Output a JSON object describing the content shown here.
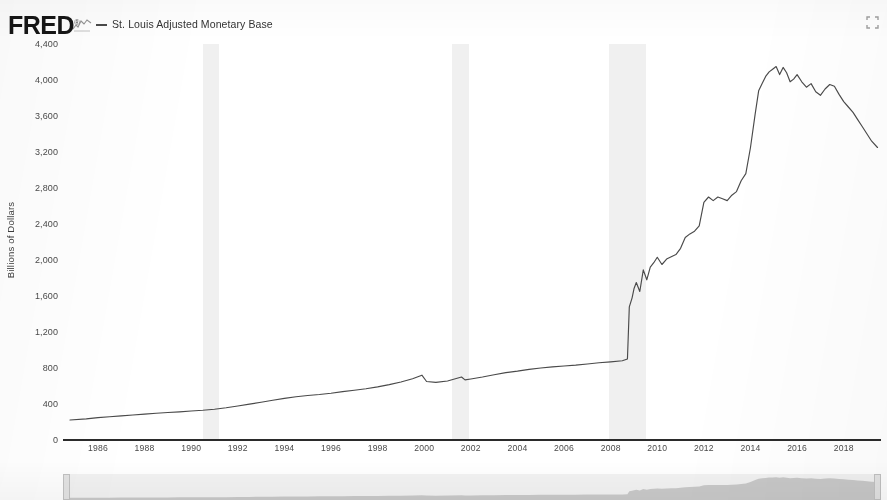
{
  "header": {
    "logo_text": "FRED",
    "logo_mark": "®",
    "squiggle_icon_name": "fred-line-chart-icon",
    "expand_icon_name": "fullscreen-expand-icon",
    "legend": [
      {
        "label": "St. Louis Adjusted Monetary Base",
        "color": "#4a4a4a"
      }
    ]
  },
  "chart_data": {
    "type": "line",
    "title": "",
    "subtitle": "",
    "xlabel": "",
    "ylabel": "Billions of Dollars",
    "legend_position": "top-left",
    "grid": false,
    "xlim": [
      1984.5,
      2019.6
    ],
    "ylim": [
      0,
      4400
    ],
    "y_ticks": [
      0,
      400,
      800,
      1200,
      1600,
      2000,
      2400,
      2800,
      3200,
      3600,
      4000,
      4400
    ],
    "y_tick_labels": [
      "0",
      "400",
      "800",
      "1,200",
      "1,600",
      "2,000",
      "2,400",
      "2,800",
      "3,200",
      "3,600",
      "4,000",
      "4,400"
    ],
    "x_ticks": [
      1986,
      1988,
      1990,
      1992,
      1994,
      1996,
      1998,
      2000,
      2002,
      2004,
      2006,
      2008,
      2010,
      2012,
      2014,
      2016,
      2018
    ],
    "x_tick_labels": [
      "1986",
      "1988",
      "1990",
      "1992",
      "1994",
      "1996",
      "1998",
      "2000",
      "2002",
      "2004",
      "2006",
      "2008",
      "2010",
      "2012",
      "2014",
      "2016",
      "2018"
    ],
    "line_color": "#4a4a4a",
    "recession_bands": [
      {
        "start": 1990.5,
        "end": 1991.2
      },
      {
        "start": 2001.2,
        "end": 2001.9
      },
      {
        "start": 2007.95,
        "end": 2009.5
      }
    ],
    "recession_color": "#f0f0f0",
    "series": [
      {
        "name": "St. Louis Adjusted Monetary Base",
        "x": [
          1984.8,
          1985.5,
          1986.0,
          1986.5,
          1987.0,
          1987.5,
          1988.0,
          1988.5,
          1989.0,
          1989.5,
          1990.0,
          1990.5,
          1991.0,
          1991.5,
          1992.0,
          1992.5,
          1993.0,
          1993.5,
          1994.0,
          1994.5,
          1995.0,
          1995.5,
          1996.0,
          1996.5,
          1997.0,
          1997.5,
          1998.0,
          1998.5,
          1999.0,
          1999.5,
          1999.9,
          2000.1,
          2000.5,
          2001.0,
          2001.6,
          2001.75,
          2002.0,
          2002.5,
          2003.0,
          2003.5,
          2004.0,
          2004.5,
          2005.0,
          2005.5,
          2006.0,
          2006.5,
          2007.0,
          2007.5,
          2008.0,
          2008.5,
          2008.72,
          2008.8,
          2008.92,
          2009.0,
          2009.1,
          2009.25,
          2009.4,
          2009.55,
          2009.7,
          2009.85,
          2010.0,
          2010.2,
          2010.4,
          2010.6,
          2010.8,
          2011.0,
          2011.2,
          2011.4,
          2011.6,
          2011.8,
          2012.0,
          2012.2,
          2012.4,
          2012.6,
          2012.8,
          2013.0,
          2013.2,
          2013.4,
          2013.6,
          2013.8,
          2014.0,
          2014.2,
          2014.35,
          2014.5,
          2014.65,
          2014.8,
          2014.95,
          2015.1,
          2015.25,
          2015.4,
          2015.55,
          2015.7,
          2015.85,
          2016.0,
          2016.2,
          2016.4,
          2016.6,
          2016.8,
          2017.0,
          2017.2,
          2017.4,
          2017.6,
          2017.8,
          2018.0,
          2018.2,
          2018.4,
          2018.6,
          2018.8,
          2019.0,
          2019.2,
          2019.45
        ],
        "y": [
          222,
          235,
          248,
          258,
          268,
          278,
          288,
          297,
          306,
          313,
          322,
          330,
          342,
          358,
          378,
          398,
          420,
          442,
          462,
          480,
          495,
          505,
          520,
          538,
          553,
          570,
          590,
          615,
          645,
          680,
          720,
          650,
          640,
          655,
          700,
          668,
          678,
          700,
          725,
          748,
          765,
          785,
          800,
          812,
          822,
          832,
          845,
          858,
          868,
          880,
          900,
          1480,
          1580,
          1680,
          1750,
          1650,
          1890,
          1780,
          1920,
          1970,
          2030,
          1950,
          2010,
          2035,
          2060,
          2130,
          2250,
          2290,
          2320,
          2380,
          2640,
          2700,
          2660,
          2700,
          2680,
          2660,
          2720,
          2760,
          2880,
          2960,
          3250,
          3620,
          3880,
          3960,
          4040,
          4090,
          4120,
          4150,
          4060,
          4140,
          4080,
          3980,
          4010,
          4060,
          3980,
          3920,
          3960,
          3870,
          3830,
          3900,
          3950,
          3930,
          3840,
          3760,
          3700,
          3640,
          3560,
          3480,
          3400,
          3320,
          3250
        ]
      }
    ]
  },
  "range_selector": {
    "left_handle_name": "range-handle-left",
    "right_handle_name": "range-handle-right"
  }
}
